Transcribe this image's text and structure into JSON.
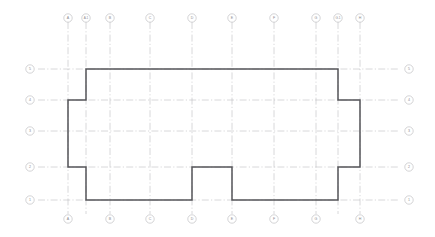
{
  "drawing": {
    "title": "Architectural Floor Plan Grid",
    "type": "floor-plan",
    "canvas": {
      "width": 435,
      "height": 237
    },
    "background_color": "#ffffff",
    "wall_color": "#56565a",
    "grid_color": "#b9b9bd",
    "bubble_text_color": "#8a8a8e"
  },
  "grid": {
    "vertical_axes": [
      {
        "label": "A",
        "x": 68,
        "top_bubble": true,
        "bottom_bubble": true
      },
      {
        "label": "A.1",
        "x": 86,
        "top_bubble": true,
        "bottom_bubble": false
      },
      {
        "label": "B",
        "x": 110,
        "top_bubble": true,
        "bottom_bubble": true
      },
      {
        "label": "C",
        "x": 150,
        "top_bubble": true,
        "bottom_bubble": true
      },
      {
        "label": "D",
        "x": 192,
        "top_bubble": true,
        "bottom_bubble": true
      },
      {
        "label": "E",
        "x": 232,
        "top_bubble": true,
        "bottom_bubble": true
      },
      {
        "label": "F",
        "x": 274,
        "top_bubble": true,
        "bottom_bubble": true
      },
      {
        "label": "G",
        "x": 316,
        "top_bubble": true,
        "bottom_bubble": true
      },
      {
        "label": "G.1",
        "x": 338,
        "top_bubble": true,
        "bottom_bubble": false
      },
      {
        "label": "H",
        "x": 360,
        "top_bubble": true,
        "bottom_bubble": true
      }
    ],
    "horizontal_axes": [
      {
        "label": "5",
        "y": 69,
        "left_bubble": true,
        "right_bubble": true
      },
      {
        "label": "4",
        "y": 100,
        "left_bubble": true,
        "right_bubble": true
      },
      {
        "label": "3",
        "y": 131,
        "left_bubble": true,
        "right_bubble": true
      },
      {
        "label": "2",
        "y": 167,
        "left_bubble": true,
        "right_bubble": true
      },
      {
        "label": "1",
        "y": 200,
        "left_bubble": true,
        "right_bubble": true
      }
    ],
    "vertical_line_extent": {
      "y_start": 22,
      "y_end": 214
    },
    "horizontal_line_extent": {
      "x_start": 38,
      "x_end": 400
    },
    "bubble_radius": 4.2,
    "top_bubble_y": 18,
    "bottom_bubble_y": 219,
    "left_bubble_x": 30,
    "right_bubble_x": 409
  },
  "building_outline": {
    "description": "Closed polygon wall outline with recessed corners and a bottom notch",
    "points": "86,69 338,69 338,100 360,100 360,167 338,167 338,200 232,200 232,167 192,167 192,200 86,200 86,167 68,167 68,100 86,100 86,69"
  }
}
